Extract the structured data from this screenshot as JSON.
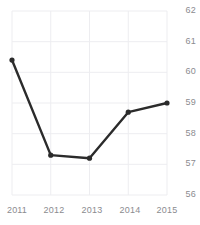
{
  "chart_data": {
    "type": "line",
    "title": "",
    "subtitle": "",
    "xlabel": "",
    "ylabel": "",
    "categories": [
      "2011",
      "2012",
      "2013",
      "2014",
      "2015"
    ],
    "x": [
      2011,
      2012,
      2013,
      2014,
      2015
    ],
    "values": [
      60.4,
      57.3,
      57.2,
      58.7,
      59.0
    ],
    "series": [
      {
        "name": "",
        "values": [
          60.4,
          57.3,
          57.2,
          58.7,
          59.0
        ]
      }
    ],
    "ylim": [
      56,
      62
    ],
    "xlim": [
      2011,
      2015
    ],
    "y_ticks": [
      56,
      57,
      58,
      59,
      60,
      61,
      62
    ],
    "y_tick_labels": [
      "56",
      "57",
      "58",
      "59",
      "60",
      "61",
      "62"
    ],
    "x_ticks": [
      2011,
      2012,
      2013,
      2014,
      2015
    ],
    "x_tick_labels": [
      "2011",
      "2012",
      "2013",
      "2014",
      "2015"
    ],
    "grid": true,
    "grid_axis": "both",
    "legend": false,
    "legend_position": "none",
    "y_axis_side": "right",
    "markers": true,
    "marker_shape": "circle",
    "annotations": []
  },
  "style": {
    "line_color": "#2b2b2b",
    "marker_color": "#2b2b2b",
    "grid_color": "#ededf0",
    "tick_label_color": "#8b8b8f",
    "background_color": "#ffffff",
    "line_width": 2.4,
    "marker_radius": 2.6
  },
  "labels": {
    "y_56": "56",
    "y_57": "57",
    "y_58": "58",
    "y_59": "59",
    "y_60": "60",
    "y_61": "61",
    "y_62": "62",
    "x_2011": "2011",
    "x_2012": "2012",
    "x_2013": "2013",
    "x_2014": "2014",
    "x_2015": "2015"
  }
}
